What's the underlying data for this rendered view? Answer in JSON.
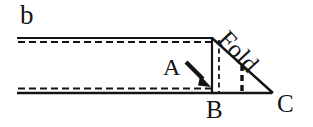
{
  "figure": {
    "type": "geometric-line-diagram",
    "canvas": {
      "width": 313,
      "height": 127,
      "background": "#ffffff"
    },
    "ink_color": "#141414",
    "labels": {
      "panel": "b",
      "point_a": "A",
      "point_b": "B",
      "point_c": "C",
      "fold": "Fold"
    },
    "geometry": {
      "strip": {
        "left_x": 17,
        "right_x": 212,
        "top_solid_y": 38,
        "top_dashed_y": 42,
        "bottom_dashed_y": 89,
        "bottom_solid_y": 93
      },
      "triangle": {
        "apex": [
          212,
          38
        ],
        "bottom_left": [
          212,
          93
        ],
        "bottom_right": [
          272,
          93
        ]
      },
      "dashed_vertical_inner_x": 219,
      "dashed_vertical_thick_x": 242,
      "arrow": {
        "from": [
          186,
          62
        ],
        "to": [
          210,
          86
        ]
      }
    }
  }
}
